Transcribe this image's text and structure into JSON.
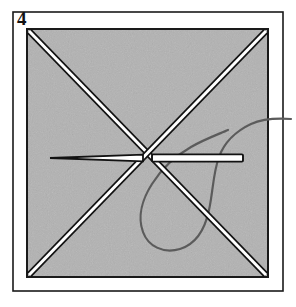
{
  "figure": {
    "step_label": "4",
    "caption": "",
    "width": 296,
    "height": 307,
    "background_color": "#ffffff"
  },
  "colors": {
    "page_background": "#ffffff",
    "frame_stroke": "#1a1a1a",
    "panel_fill": "#b2b2b2",
    "panel_stroke": "#1a1a1a",
    "line_dark": "#121212",
    "line_highlight": "#ffffff",
    "thread_stroke": "#5b5b5b",
    "label_color": "#121212"
  },
  "frame": {
    "name": "outer-frame",
    "x": 13,
    "y": 12,
    "width": 270,
    "height": 279,
    "stroke_width": 1.6
  },
  "panel": {
    "name": "gray-square-panel",
    "x": 27,
    "y": 29,
    "width": 241,
    "height": 248,
    "stroke_width": 2
  },
  "diagonals": [
    {
      "name": "diagonal-top-left-to-bottom-right",
      "x1": 29,
      "y1": 31,
      "x2": 266,
      "y2": 275,
      "width": 6
    },
    {
      "name": "diagonal-top-right-to-bottom-left",
      "x1": 266,
      "y1": 31,
      "x2": 29,
      "y2": 275,
      "width": 6
    }
  ],
  "needle": {
    "name": "needle-left",
    "tip_x": 50,
    "tip_y": 158,
    "base_x": 143,
    "base_y": 158,
    "width": 6
  },
  "bar": {
    "name": "bar-right",
    "x1": 152,
    "y1": 158,
    "x2": 243,
    "y2": 158,
    "width": 7
  },
  "thread": {
    "name": "thread-loop",
    "stroke_width": 2.2,
    "path": "M 291 119 C 276 118 262 119 251 124 C 236 131 224 143 219 157 C 213 173 213 192 209 210 C 205 229 196 244 180 249 C 163 254 148 246 143 232 C 137 216 143 198 152 184 C 162 168 177 155 191 147 C 205 139 219 134 228 130"
  },
  "crossing_point": {
    "name": "center-crossing",
    "x": 147,
    "y": 153
  }
}
